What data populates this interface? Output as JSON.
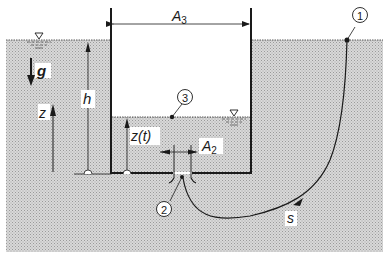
{
  "diagram": {
    "labels": {
      "area_top": "A",
      "area_top_sub": "3",
      "area_orifice": "A",
      "area_orifice_sub": "2",
      "gravity": "g",
      "height": "h",
      "z_axis": "z",
      "level": "z(t)",
      "streamline": "s"
    },
    "points": [
      "1",
      "2",
      "3"
    ],
    "colors": {
      "water": "#cfcfcf",
      "ink": "#1a1a1a",
      "background": "#ffffff"
    }
  }
}
